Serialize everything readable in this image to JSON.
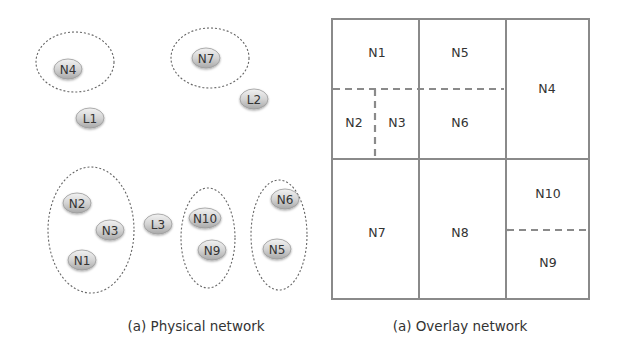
{
  "physical": {
    "caption": "(a) Physical network",
    "clusters": [
      {
        "cx": 75,
        "cy": 62,
        "rx": 39,
        "ry": 30
      },
      {
        "cx": 210,
        "cy": 58,
        "rx": 39,
        "ry": 30
      },
      {
        "cx": 91,
        "cy": 230,
        "rx": 43,
        "ry": 63
      },
      {
        "cx": 208,
        "cy": 238,
        "rx": 27,
        "ry": 50
      },
      {
        "cx": 279,
        "cy": 235,
        "rx": 28,
        "ry": 55
      }
    ],
    "nodes": [
      {
        "label": "N4",
        "x": 68,
        "y": 69
      },
      {
        "label": "L1",
        "x": 90,
        "y": 118
      },
      {
        "label": "N7",
        "x": 206,
        "y": 58
      },
      {
        "label": "L2",
        "x": 254,
        "y": 99
      },
      {
        "label": "N2",
        "x": 77,
        "y": 203
      },
      {
        "label": "N3",
        "x": 110,
        "y": 230
      },
      {
        "label": "N1",
        "x": 82,
        "y": 260
      },
      {
        "label": "L3",
        "x": 158,
        "y": 224
      },
      {
        "label": "N10",
        "x": 205,
        "y": 218
      },
      {
        "label": "N9",
        "x": 212,
        "y": 250
      },
      {
        "label": "N6",
        "x": 285,
        "y": 199
      },
      {
        "label": "N5",
        "x": 277,
        "y": 249
      }
    ]
  },
  "overlay": {
    "caption": "(a) Overlay network",
    "cells": [
      {
        "label": "N1",
        "x": 377,
        "y": 52
      },
      {
        "label": "N5",
        "x": 460,
        "y": 52
      },
      {
        "label": "N4",
        "x": 547,
        "y": 88
      },
      {
        "label": "N2",
        "x": 354,
        "y": 122
      },
      {
        "label": "N3",
        "x": 397,
        "y": 122
      },
      {
        "label": "N6",
        "x": 460,
        "y": 122
      },
      {
        "label": "N7",
        "x": 377,
        "y": 232
      },
      {
        "label": "N8",
        "x": 460,
        "y": 232
      },
      {
        "label": "N10",
        "x": 548,
        "y": 193
      },
      {
        "label": "N9",
        "x": 548,
        "y": 262
      }
    ]
  }
}
